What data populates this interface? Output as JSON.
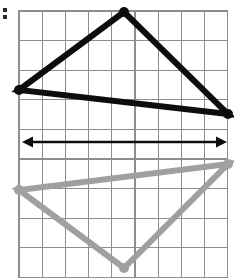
{
  "figure": {
    "canvas": {
      "width": 234,
      "height": 278,
      "background": "#ffffff"
    },
    "grid": {
      "origin_x": 19,
      "origin_y": 11,
      "cell_width": 23.2,
      "cell_height": 29.6,
      "columns": 9,
      "rows": 9,
      "line_color": "#8d8d8d",
      "border_color": "#8d8d8d",
      "visible": true
    },
    "shapes": [
      {
        "id": "pre-image-triangle",
        "label": "black triangle",
        "role": "pre-image",
        "color": "#0d0d0d",
        "stroke_width": 6,
        "closed": true,
        "vertex_marker": "dot",
        "vertices": [
          {
            "name": "apex",
            "x": 124,
            "y": 12,
            "grid_col": 4.5,
            "grid_row": 0
          },
          {
            "name": "left",
            "x": 19,
            "y": 90,
            "grid_col": 0,
            "grid_row": 2.7
          },
          {
            "name": "right",
            "x": 228,
            "y": 114,
            "grid_col": 9,
            "grid_row": 3.5
          }
        ]
      },
      {
        "id": "image-triangle",
        "label": "gray triangle",
        "role": "image",
        "color": "#a0a0a0",
        "stroke_width": 6,
        "closed": true,
        "vertex_marker": "dot",
        "vertices": [
          {
            "name": "apex",
            "x": 124,
            "y": 268,
            "grid_col": 4.5,
            "grid_row": 8.7
          },
          {
            "name": "left",
            "x": 19,
            "y": 190,
            "grid_col": 0,
            "grid_row": 6.0
          },
          {
            "name": "right",
            "x": 228,
            "y": 164,
            "grid_col": 9,
            "grid_row": 5.2
          }
        ]
      }
    ],
    "axis_of_reflection": {
      "id": "reflection-line",
      "label": "double-headed arrow (line of reflection)",
      "color": "#0d0d0d",
      "y": 142,
      "x_start": 22,
      "x_end": 227,
      "arrowheads": "both",
      "stroke_width": 2.6
    },
    "corner_mark": {
      "id": "corner-tick",
      "label": "left edge tick mark",
      "x": 3,
      "y": 8,
      "width": 4,
      "height": 11,
      "color": "#2a2a2a"
    }
  }
}
